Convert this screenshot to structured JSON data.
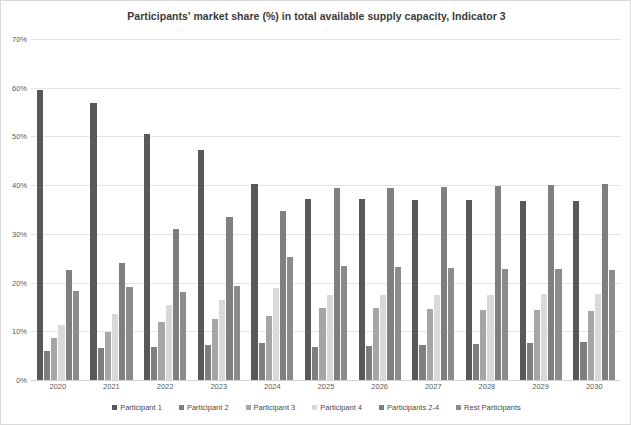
{
  "chart_data": {
    "type": "bar",
    "title": "Participants' market share (%) in total available supply capacity, Indicator 3",
    "xlabel": "",
    "ylabel": "",
    "ylim": [
      0,
      70
    ],
    "ytick_labels": [
      "0%",
      "10%",
      "20%",
      "30%",
      "40%",
      "50%",
      "60%",
      "70%"
    ],
    "ytick_values": [
      0,
      10,
      20,
      30,
      40,
      50,
      60,
      70
    ],
    "grid": true,
    "legend_position": "bottom",
    "categories": [
      "2020",
      "2021",
      "2022",
      "2023",
      "2024",
      "2025",
      "2026",
      "2027",
      "2028",
      "2029",
      "2030"
    ],
    "series": [
      {
        "name": "Participant 1",
        "color": "#595959",
        "values": [
          59.6,
          56.8,
          50.6,
          47.2,
          40.2,
          37.1,
          37.1,
          37.0,
          36.9,
          36.8,
          36.7
        ]
      },
      {
        "name": "Participant 2",
        "color": "#7f7f7f",
        "values": [
          5.9,
          6.5,
          6.7,
          7.1,
          7.5,
          6.8,
          7.0,
          7.2,
          7.4,
          7.6,
          7.8
        ]
      },
      {
        "name": "Participant 3",
        "color": "#a6a6a6",
        "values": [
          8.7,
          9.8,
          12.0,
          12.6,
          13.1,
          14.7,
          14.7,
          14.5,
          14.4,
          14.3,
          14.2
        ]
      },
      {
        "name": "Participant 4",
        "color": "#d9d9d9",
        "values": [
          11.3,
          13.5,
          15.4,
          16.4,
          18.8,
          17.5,
          17.4,
          17.5,
          17.5,
          17.6,
          17.6
        ]
      },
      {
        "name": "Participants 2-4",
        "color": "#7f7f7f",
        "values": [
          22.6,
          24.1,
          31.1,
          33.5,
          34.6,
          39.4,
          39.5,
          39.7,
          39.9,
          40.1,
          40.2
        ]
      },
      {
        "name": "Rest Participants",
        "color": "#8c8c8c",
        "values": [
          18.3,
          19.0,
          18.1,
          19.3,
          25.2,
          23.4,
          23.1,
          22.9,
          22.8,
          22.8,
          22.6
        ]
      }
    ]
  }
}
